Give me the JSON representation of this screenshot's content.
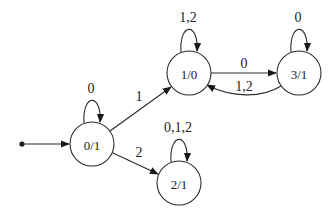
{
  "diagram": {
    "type": "finite-state-machine",
    "stroke_color": "#2a2a2a",
    "start_state": "0/1",
    "nodes": [
      {
        "id": "n01",
        "label": "0/1",
        "x": 92,
        "y": 144,
        "r": 22
      },
      {
        "id": "n10",
        "label": "1/0",
        "x": 189,
        "y": 73,
        "r": 22
      },
      {
        "id": "n31",
        "label": "3/1",
        "x": 299,
        "y": 73,
        "r": 22
      },
      {
        "id": "n21",
        "label": "2/1",
        "x": 179,
        "y": 183,
        "r": 22
      }
    ],
    "edges": [
      {
        "from": "start",
        "to": "0/1",
        "label": ""
      },
      {
        "from": "0/1",
        "to": "0/1",
        "label": "0"
      },
      {
        "from": "0/1",
        "to": "1/0",
        "label": "1"
      },
      {
        "from": "0/1",
        "to": "2/1",
        "label": "2"
      },
      {
        "from": "1/0",
        "to": "1/0",
        "label": "1,2"
      },
      {
        "from": "1/0",
        "to": "3/1",
        "label": "0"
      },
      {
        "from": "3/1",
        "to": "3/1",
        "label": "0"
      },
      {
        "from": "3/1",
        "to": "1/0",
        "label": "1,2"
      },
      {
        "from": "2/1",
        "to": "2/1",
        "label": "0,1,2"
      }
    ]
  },
  "labels": {
    "node_01": "0/1",
    "node_10": "1/0",
    "node_31": "3/1",
    "node_21": "2/1",
    "loop_01": "0",
    "loop_10": "1,2",
    "loop_31": "0",
    "loop_21": "0,1,2",
    "edge_01_10": "1",
    "edge_01_21": "2",
    "edge_10_31": "0",
    "edge_31_10": "1,2"
  }
}
